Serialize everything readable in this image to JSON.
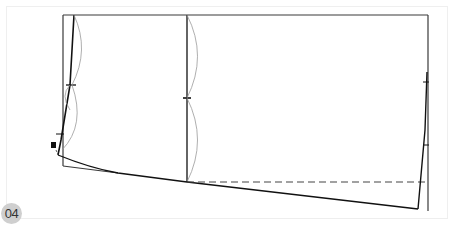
{
  "figure": {
    "label": "04",
    "colors": {
      "outline": "#3a3a3a",
      "pattern_line": "#111111",
      "guide_curve": "#9a9a9a",
      "dashed_line": "#444444",
      "badge_bg": "#cfcfcf",
      "badge_text": "#333333"
    }
  }
}
